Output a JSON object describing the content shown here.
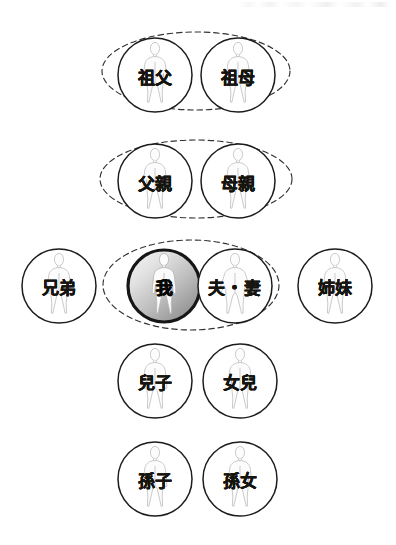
{
  "diagram": {
    "type": "family-kinship-chart",
    "background_color": "#ffffff",
    "circle_stroke_color": "#1a1a1a",
    "figure_stroke_color": "#b9b9b9",
    "dashed_ellipse_color": "#303030",
    "highlight_gradient": {
      "from": "#f2f2f2",
      "to": "#8d8d8d",
      "border": "#171717"
    },
    "rows": [
      {
        "id": "grandparents",
        "grouped": true,
        "nodes": [
          {
            "id": "grandfather",
            "label": "祖父",
            "highlighted": false,
            "figure": "standing-person"
          },
          {
            "id": "grandmother",
            "label": "祖母",
            "highlighted": false,
            "figure": "standing-person"
          }
        ]
      },
      {
        "id": "parents",
        "grouped": true,
        "nodes": [
          {
            "id": "father",
            "label": "父親",
            "highlighted": false,
            "figure": "standing-person"
          },
          {
            "id": "mother",
            "label": "母親",
            "highlighted": false,
            "figure": "standing-person"
          }
        ]
      },
      {
        "id": "self-generation",
        "grouped": true,
        "nodes": [
          {
            "id": "brothers",
            "label": "兄弟",
            "highlighted": false,
            "figure": "standing-person"
          },
          {
            "id": "self",
            "label": "我",
            "highlighted": true,
            "figure": "standing-person"
          },
          {
            "id": "spouse",
            "label": "夫・妻",
            "highlighted": false,
            "figure": "standing-person-wide"
          },
          {
            "id": "sisters",
            "label": "姉妹",
            "highlighted": false,
            "figure": "standing-person"
          }
        ]
      },
      {
        "id": "children",
        "grouped": false,
        "nodes": [
          {
            "id": "son",
            "label": "兒子",
            "highlighted": false,
            "figure": "standing-person"
          },
          {
            "id": "daughter",
            "label": "女兒",
            "highlighted": false,
            "figure": "standing-person"
          }
        ]
      },
      {
        "id": "grandchildren",
        "grouped": false,
        "nodes": [
          {
            "id": "grandson",
            "label": "孫子",
            "highlighted": false,
            "figure": "standing-person"
          },
          {
            "id": "granddaughter",
            "label": "孫女",
            "highlighted": false,
            "figure": "standing-person"
          }
        ]
      }
    ],
    "labels": {
      "grandfather": "祖父",
      "grandmother": "祖母",
      "father": "父親",
      "mother": "母親",
      "brothers": "兄弟",
      "self": "我",
      "spouse": "夫・妻",
      "sisters": "姉妹",
      "son": "兒子",
      "daughter": "女兒",
      "grandson": "孫子",
      "granddaughter": "孫女"
    }
  }
}
